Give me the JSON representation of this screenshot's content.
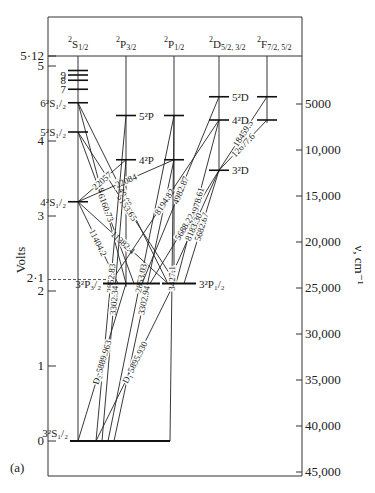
{
  "figure_label": "(a)",
  "left_axis": {
    "title": "Volts",
    "ticks": [
      {
        "v": 0,
        "label": "0"
      },
      {
        "v": 1,
        "label": "1"
      },
      {
        "v": 2,
        "label": "2"
      },
      {
        "v": 3,
        "label": "3"
      },
      {
        "v": 4,
        "label": "4"
      },
      {
        "v": 5,
        "label": "5"
      },
      {
        "v": 5.12,
        "label": "5·12"
      }
    ],
    "marker_2_1": {
      "v": 2.1,
      "label": "2·1"
    }
  },
  "right_axis": {
    "title": "ν, cm⁻¹",
    "ticks": [
      "5000",
      "10,000",
      "15,000",
      "20,000",
      "25,000",
      "30,000",
      "35,000",
      "40,000",
      "45,000"
    ]
  },
  "columns": [
    {
      "id": "S",
      "label_main": "S",
      "label_sub": "1/2",
      "label_sup": "2"
    },
    {
      "id": "P32",
      "label_main": "P",
      "label_sub": "3/2",
      "label_sup": "2"
    },
    {
      "id": "P12",
      "label_main": "P",
      "label_sub": "1/2",
      "label_sup": "2"
    },
    {
      "id": "D",
      "label_main": "D",
      "label_sub": "5/2, 3/2",
      "label_sup": "2"
    },
    {
      "id": "F",
      "label_main": "F",
      "label_sub": "7/2, 5/2",
      "label_sup": "2"
    }
  ],
  "levels": [
    {
      "id": "3S",
      "col": "S",
      "volts": 0.0,
      "label": "3²S₁/₂"
    },
    {
      "id": "4S",
      "col": "S",
      "volts": 3.19,
      "label": "4²S₁/₂"
    },
    {
      "id": "5S",
      "col": "S",
      "volts": 4.12,
      "label": "5²S₁/₂"
    },
    {
      "id": "6S",
      "col": "S",
      "volts": 4.51,
      "label": "6²S₁/₂"
    },
    {
      "id": "7S",
      "col": "S",
      "volts": 4.69,
      "label": "7"
    },
    {
      "id": "8S",
      "col": "S",
      "volts": 4.81,
      "label": "8"
    },
    {
      "id": "9S",
      "col": "S",
      "volts": 4.88,
      "label": "9"
    },
    {
      "id": "10S",
      "col": "S",
      "volts": 4.94,
      "label": ""
    },
    {
      "id": "3P32",
      "col": "P32",
      "volts": 2.1,
      "label": "3²P₃/₂"
    },
    {
      "id": "4P32",
      "col": "P32",
      "volts": 3.75,
      "label": "4²P"
    },
    {
      "id": "5P32",
      "col": "P32",
      "volts": 4.34,
      "label": "5²P"
    },
    {
      "id": "3P12",
      "col": "P12",
      "volts": 2.1,
      "label": "3²P₁/₂"
    },
    {
      "id": "4P12",
      "col": "P12",
      "volts": 3.75,
      "label": ""
    },
    {
      "id": "5P12",
      "col": "P12",
      "volts": 4.34,
      "label": ""
    },
    {
      "id": "3D",
      "col": "D",
      "volts": 3.61,
      "label": "3²D"
    },
    {
      "id": "4D",
      "col": "D",
      "volts": 4.28,
      "label": "4²D"
    },
    {
      "id": "5D",
      "col": "D",
      "volts": 4.59,
      "label": "5²D"
    },
    {
      "id": "4F",
      "col": "F",
      "volts": 4.59,
      "label": ""
    },
    {
      "id": "5F",
      "col": "F",
      "volts": 4.28,
      "label": ""
    }
  ],
  "transitions": [
    {
      "from": "6S",
      "to": "3P12",
      "label": "5149.09"
    },
    {
      "from": "5S",
      "to": "3P12",
      "label": "5153.65"
    },
    {
      "from": "6S",
      "to": "3P32",
      "label": "5184.27"
    },
    {
      "from": "5S",
      "to": "3P32",
      "label": "6160.73"
    },
    {
      "from": "4S",
      "to": "4P32",
      "label": "22057"
    },
    {
      "from": "4S",
      "to": "4P12",
      "label": "22084"
    },
    {
      "from": "4S",
      "to": "3P12",
      "label": "11382.4"
    },
    {
      "from": "4S",
      "to": "3P32",
      "label": "11404.2"
    },
    {
      "from": "5P12",
      "to": "3S",
      "label": "2853.03"
    },
    {
      "from": "4P12",
      "to": "3S",
      "label": "3302.94"
    },
    {
      "from": "5D",
      "to": "3P32",
      "label": "4982.87"
    },
    {
      "from": "3D",
      "to": "3P32",
      "label": "5688.22"
    },
    {
      "from": "4D",
      "to": "3P32",
      "label": "8194.82"
    },
    {
      "from": "4D",
      "to": "3P12",
      "label": "4978.61"
    },
    {
      "from": "3D",
      "to": "3P12",
      "label": "5682.67"
    },
    {
      "from": "3D",
      "to": "3P12",
      "label": "8183.30"
    },
    {
      "from": "5F",
      "to": "3D",
      "label": "12677.6"
    },
    {
      "from": "4F",
      "to": "3D",
      "label": "18459.5"
    },
    {
      "from": "5P32",
      "to": "3S",
      "label": "2852.83"
    },
    {
      "from": "4P32",
      "to": "3S",
      "label": "3302.34"
    },
    {
      "from": "3P32",
      "to": "3S",
      "label": "D₂ 5889.963"
    },
    {
      "from": "3P12",
      "to": "3S",
      "label": "D₁ 5895.930"
    },
    {
      "from": "5P12",
      "to": "3S",
      "label": "3427.1"
    }
  ]
}
